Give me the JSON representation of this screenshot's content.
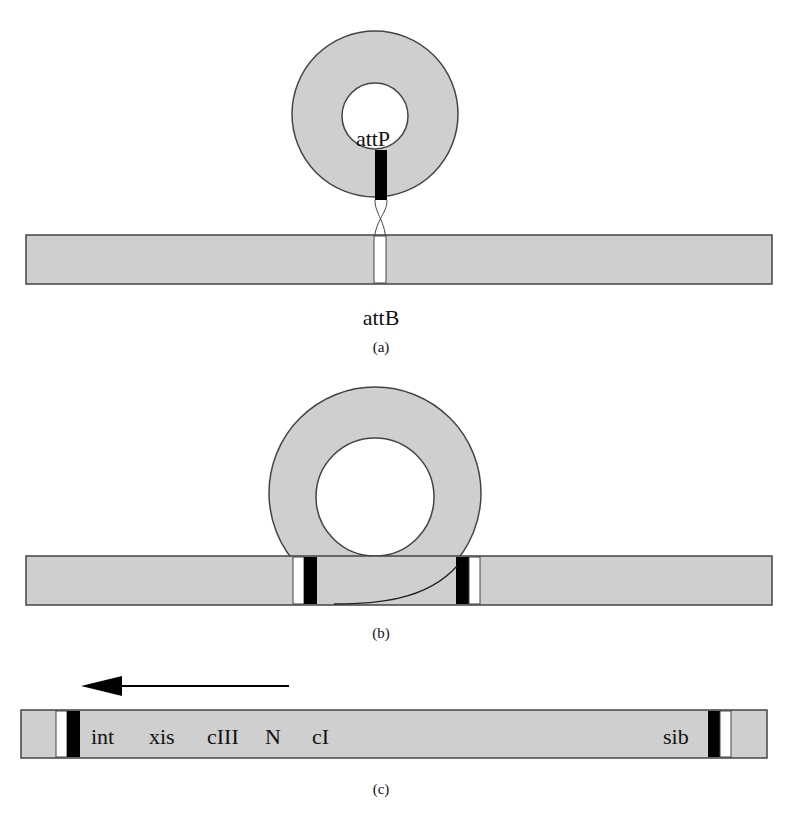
{
  "colors": {
    "dna_fill": "#cfcfcf",
    "stroke": "#444444",
    "att_core": "#000000",
    "att_flank": "#ffffff",
    "text": "#111111"
  },
  "panel_a": {
    "caption": "(a)",
    "phage_circle": {
      "cx": 375,
      "cy": 114,
      "r_outer": 83,
      "r_inner": 33,
      "inner_cy": 116
    },
    "attP": {
      "label": "attP",
      "x": 373,
      "y": 146,
      "bar": {
        "x": 375,
        "y": 150,
        "w": 12,
        "h": 50
      }
    },
    "chromosome": {
      "x": 26,
      "y": 235,
      "w": 746,
      "h": 49
    },
    "attB": {
      "label": "attB",
      "x": 381,
      "y": 325,
      "gap": {
        "x": 374,
        "w": 12
      }
    },
    "caption_pos": {
      "x": 381,
      "y": 352
    }
  },
  "panel_b": {
    "caption": "(b)",
    "ring": {
      "cx": 375,
      "cy": 493,
      "r_outer": 106,
      "r_inner": 59,
      "inner_cy": 497
    },
    "chromosome": {
      "x": 26,
      "y": 556,
      "w": 746,
      "h": 49
    },
    "left_site": {
      "white_x": 293,
      "white_w": 11,
      "black_x": 304,
      "black_w": 13
    },
    "right_site": {
      "black_x": 456,
      "black_w": 13,
      "white_x": 469,
      "white_w": 11
    },
    "caption_pos": {
      "x": 381,
      "y": 638
    }
  },
  "panel_c": {
    "caption": "(c)",
    "arrow": {
      "x_tip": 81,
      "x_base": 122,
      "x_end": 289,
      "y": 686,
      "half_h": 10,
      "direction": "leftward"
    },
    "prophage": {
      "x": 21,
      "y": 710,
      "w": 746,
      "h": 48
    },
    "left_site": {
      "white_x": 56,
      "white_w": 11,
      "black_x": 67,
      "black_w": 13
    },
    "right_site": {
      "black_x": 708,
      "black_w": 12,
      "white_x": 720,
      "white_w": 11
    },
    "genes": [
      {
        "label": "int",
        "x": 91
      },
      {
        "label": "xis",
        "x": 149
      },
      {
        "label": "cIII",
        "x": 207
      },
      {
        "label": "N",
        "x": 265
      },
      {
        "label": "cI",
        "x": 312
      },
      {
        "label": "sib",
        "x": 663
      }
    ],
    "gene_baseline": 744,
    "caption_pos": {
      "x": 381,
      "y": 794
    }
  }
}
